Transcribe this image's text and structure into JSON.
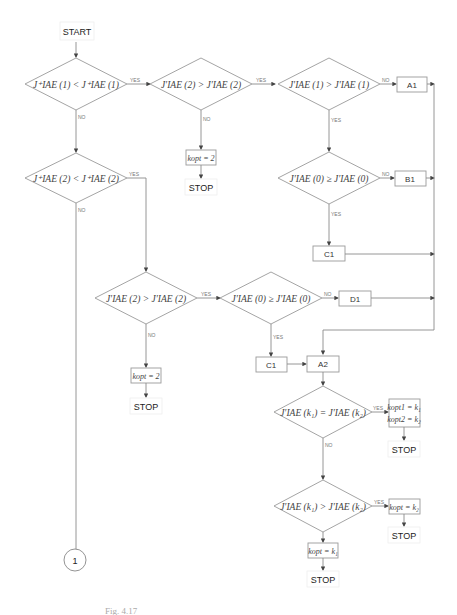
{
  "flowchart": {
    "start": "START",
    "stop": "STOP",
    "connector": "1",
    "labels": {
      "yes": "YES",
      "no": "NO"
    },
    "decisions": {
      "d1": "J⁺IAE (1) < J⁺IAE (1)",
      "d2": "J⁺IAE (2) < J⁺IAE (2)",
      "d3": "J′IAE (2) > J′IAE (2)",
      "d4": "J′IAE (1) > J′IAE (1)",
      "d5": "J′IAE (0) ≥ J′IAE (0)",
      "d6": "J′IAE (2) > J′IAE (2)",
      "d7": "J′IAE (0) ≥ J′IAE (0)",
      "d8": "J′IAE (k₁) = J′IAE (k₂)",
      "d9": "J′IAE (k₁) > J′IAE (k₂)"
    },
    "processes": {
      "a1": "A1",
      "b1": "B1",
      "c1_top": "C1",
      "d1": "D1",
      "c1_bottom": "C1",
      "a2": "A2",
      "kopt_2_top": "kopt = 2",
      "kopt_2_bottom": "kopt = 2",
      "kopt_both_line1": "kopt1 = k₁",
      "kopt_both_line2": "kopt2 = k₂",
      "kopt_k2": "kopt = k₂",
      "kopt_k1": "kopt = k₁"
    }
  },
  "caption": "Fig. 4.17"
}
